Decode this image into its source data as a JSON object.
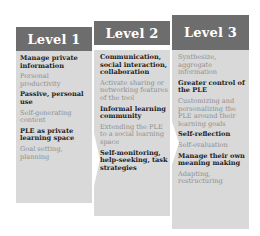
{
  "diagram": {
    "levels": [
      {
        "title": "Level 1",
        "items": [
          {
            "text": "Manage private information",
            "style": "dark"
          },
          {
            "text": "Personal productivity",
            "style": "light"
          },
          {
            "text": "Passive, personal use",
            "style": "dark"
          },
          {
            "text": "Self-generating content",
            "style": "light"
          },
          {
            "text": "PLE as private learning space",
            "style": "dark"
          },
          {
            "text": "Goal setting, planning",
            "style": "light"
          }
        ]
      },
      {
        "title": "Level 2",
        "items": [
          {
            "text": "Communication, social interaction, collaboration",
            "style": "dark"
          },
          {
            "text": "Activate sharing or networking features of the tool",
            "style": "light"
          },
          {
            "text": "Informal learning community",
            "style": "dark"
          },
          {
            "text": "Extending the PLE to a social learning space",
            "style": "light"
          },
          {
            "text": "Self-monitoring, help-seeking, task strategies",
            "style": "dark"
          }
        ]
      },
      {
        "title": "Level 3",
        "items": [
          {
            "text": "Synthesize, aggregate information",
            "style": "light"
          },
          {
            "text": "Greater control of the PLE",
            "style": "dark"
          },
          {
            "text": "Customizing and personalizing the PLE around their learning goals",
            "style": "light"
          },
          {
            "text": "Self-reflection",
            "style": "dark"
          },
          {
            "text": "Self-evaluation",
            "style": "light"
          },
          {
            "text": "Manage their own meaning making",
            "style": "dark"
          },
          {
            "text": "Adapting, restructuring",
            "style": "light"
          }
        ]
      }
    ],
    "colors": {
      "header": "#6d6d6d",
      "body": "#d9d9d9",
      "dark_text": "#222222",
      "light_text": "#8e8e8e"
    }
  }
}
